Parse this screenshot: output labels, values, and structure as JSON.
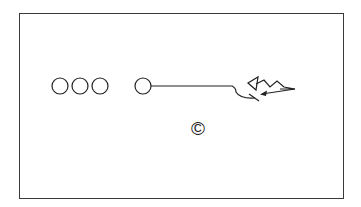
{
  "diagram": {
    "type": "football-play",
    "players": [
      {
        "id": "p1",
        "shape": "circle",
        "cx": 60,
        "cy": 86
      },
      {
        "id": "p2",
        "shape": "circle",
        "cx": 80,
        "cy": 86
      },
      {
        "id": "p3",
        "shape": "circle",
        "cx": 100,
        "cy": 86
      },
      {
        "id": "p4",
        "shape": "circle",
        "cx": 143,
        "cy": 86
      }
    ],
    "defender": {
      "shape": "triangle"
    },
    "center_marker": "©",
    "colors": {
      "stroke": "#222222",
      "frame": "#3a3a3a",
      "background": "#ffffff"
    }
  }
}
